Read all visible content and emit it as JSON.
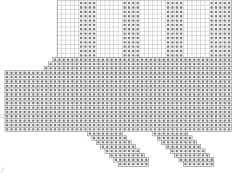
{
  "chart_data": {
    "type": "pattern-grid",
    "title": "",
    "cell_px": 4.35,
    "origin": {
      "x": 5,
      "y": 1
    },
    "cols": 52,
    "rows": 38,
    "colors": {
      "grid": "#c8c8c8",
      "outline": "#888888",
      "stitch": "#7a7a7a",
      "background": "#ffffff"
    },
    "upper_grid": {
      "col_start": 12,
      "col_end": 52,
      "row_start": 0,
      "row_end": 13
    },
    "upper_bands": [
      {
        "col_start": 17,
        "col_end": 21
      },
      {
        "col_start": 27,
        "col_end": 31
      },
      {
        "col_start": 37,
        "col_end": 41
      },
      {
        "col_start": 47,
        "col_end": 52
      }
    ],
    "body_rows": [
      {
        "row": 13,
        "col_start": 11,
        "col_end": 52
      },
      {
        "row": 14,
        "col_start": 10,
        "col_end": 52
      },
      {
        "row": 15,
        "col_start": 9,
        "col_end": 52
      },
      {
        "row": 16,
        "col_start": 0,
        "col_end": 52
      },
      {
        "row": 17,
        "col_start": 0,
        "col_end": 52
      },
      {
        "row": 18,
        "col_start": 0,
        "col_end": 52
      },
      {
        "row": 19,
        "col_start": 0,
        "col_end": 52
      },
      {
        "row": 20,
        "col_start": 0,
        "col_end": 52
      },
      {
        "row": 21,
        "col_start": 0,
        "col_end": 52
      },
      {
        "row": 22,
        "col_start": 0,
        "col_end": 52
      },
      {
        "row": 23,
        "col_start": 0,
        "col_end": 52
      },
      {
        "row": 24,
        "col_start": 0,
        "col_end": 52
      },
      {
        "row": 25,
        "col_start": 0,
        "col_end": 52
      },
      {
        "row": 26,
        "col_start": 0,
        "col_end": 52
      },
      {
        "row": 27,
        "col_start": 0,
        "col_end": 52
      },
      {
        "row": 28,
        "col_start": 0,
        "col_end": 52
      },
      {
        "row": 29,
        "col_start": 0,
        "col_end": 52
      }
    ],
    "legs": [
      {
        "rows": [
          {
            "row": 30,
            "col_start": 19,
            "col_end": 27
          },
          {
            "row": 31,
            "col_start": 20,
            "col_end": 28
          },
          {
            "row": 32,
            "col_start": 21,
            "col_end": 29
          },
          {
            "row": 33,
            "col_start": 22,
            "col_end": 30
          },
          {
            "row": 34,
            "col_start": 23,
            "col_end": 31
          },
          {
            "row": 35,
            "col_start": 24,
            "col_end": 32
          },
          {
            "row": 36,
            "col_start": 25,
            "col_end": 33
          },
          {
            "row": 37,
            "col_start": 26,
            "col_end": 33
          }
        ]
      },
      {
        "rows": [
          {
            "row": 30,
            "col_start": 34,
            "col_end": 42
          },
          {
            "row": 31,
            "col_start": 35,
            "col_end": 43
          },
          {
            "row": 32,
            "col_start": 36,
            "col_end": 44
          },
          {
            "row": 33,
            "col_start": 37,
            "col_end": 45
          },
          {
            "row": 34,
            "col_start": 38,
            "col_end": 46
          },
          {
            "row": 35,
            "col_start": 39,
            "col_end": 47
          },
          {
            "row": 36,
            "col_start": 40,
            "col_end": 48
          },
          {
            "row": 37,
            "col_start": 41,
            "col_end": 48
          }
        ]
      }
    ],
    "side_marks": [
      {
        "label": "○",
        "x": 0,
        "y": 115
      },
      {
        "label": "╱",
        "x": 1,
        "y": 170
      }
    ]
  }
}
